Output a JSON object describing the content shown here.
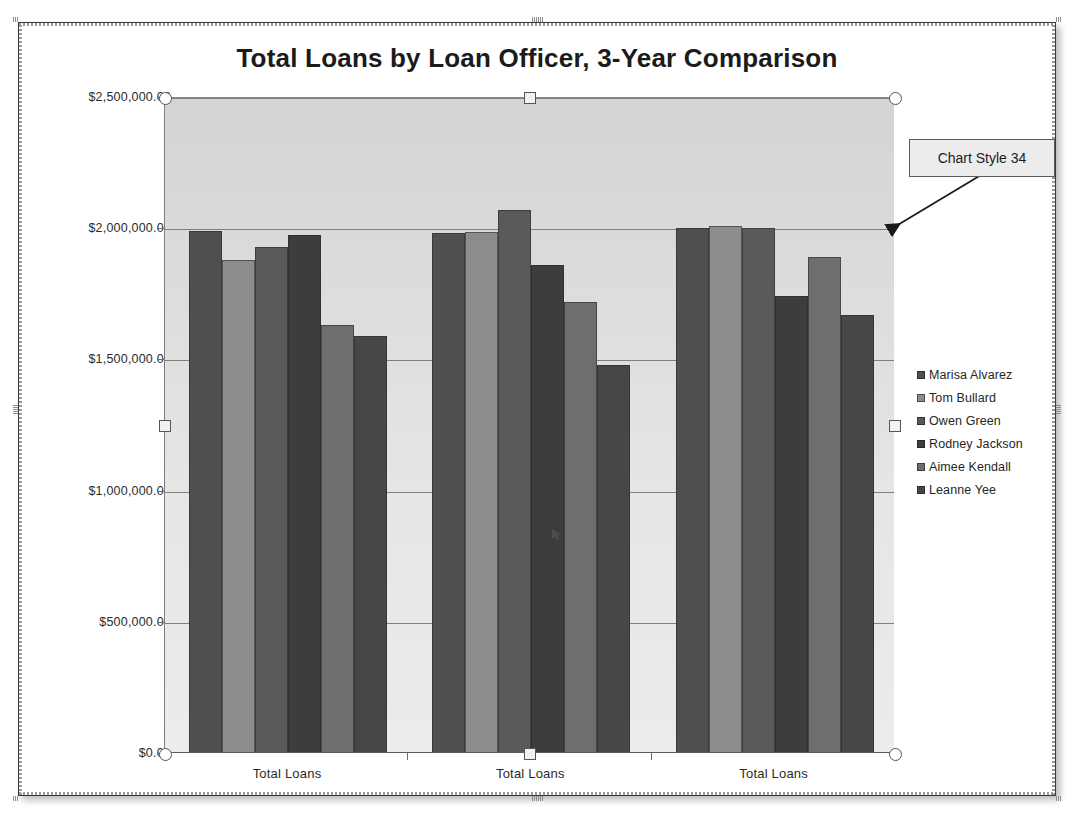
{
  "chart": {
    "title": "Total Loans by Loan Officer, 3-Year Comparison",
    "callout_label": "Chart Style 34"
  },
  "chart_data": {
    "type": "bar",
    "title": "Total Loans by Loan Officer, 3-Year Comparison",
    "xlabel": "",
    "ylabel": "",
    "grid": true,
    "legend_position": "right",
    "categories": [
      "Total Loans",
      "Total Loans",
      "Total Loans"
    ],
    "ytick_labels": [
      "$0.00",
      "$500,000.00",
      "$1,000,000.00",
      "$1,500,000.00",
      "$2,000,000.00",
      "$2,500,000.00"
    ],
    "ytick_values": [
      0,
      500000,
      1000000,
      1500000,
      2000000,
      2500000
    ],
    "ylim": [
      0,
      2500000
    ],
    "series": [
      {
        "name": "Marisa Alvarez",
        "color": "#4f4f4f",
        "values": [
          1990000,
          1980000,
          2000000
        ]
      },
      {
        "name": "Tom Bullard",
        "color": "#8c8c8c",
        "values": [
          1880000,
          1985000,
          2010000
        ]
      },
      {
        "name": "Owen Green",
        "color": "#5a5a5a",
        "values": [
          1930000,
          2070000,
          2000000
        ]
      },
      {
        "name": "Rodney Jackson",
        "color": "#3d3d3d",
        "values": [
          1975000,
          1860000,
          1740000
        ]
      },
      {
        "name": "Aimee Kendall",
        "color": "#6e6e6e",
        "values": [
          1630000,
          1720000,
          1890000
        ]
      },
      {
        "name": "Leanne Yee",
        "color": "#474747",
        "values": [
          1590000,
          1480000,
          1670000
        ]
      }
    ]
  },
  "selection": {
    "handle_top_left": "circle",
    "handle_top_center": "square",
    "handle_top_right": "circle",
    "handle_middle_left": "square",
    "handle_middle_right": "square",
    "handle_bottom_left": "circle",
    "handle_bottom_center": "square",
    "handle_bottom_right": "circle"
  }
}
